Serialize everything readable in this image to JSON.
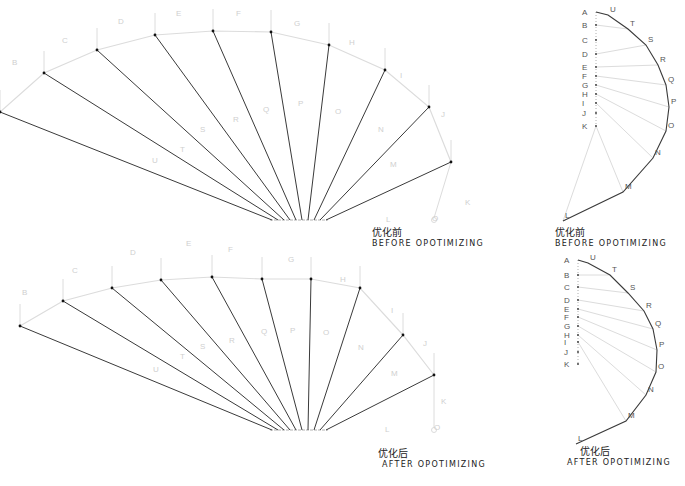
{
  "captions": {
    "before_zh": "优化前",
    "before_en": "BEFORE OPOTIMIZING",
    "after_zh": "优化后",
    "after_en": "AFTER OPOTIMIZING"
  },
  "colors": {
    "dark_line": "#3a3a3a",
    "light_line": "#dcdcdc",
    "label": "#cfcfcf",
    "label_dark": "#555555"
  },
  "diagrams": {
    "fan_before": {
      "hub": [
        [
          272,
          220
        ],
        [
          278,
          220
        ],
        [
          284,
          220
        ],
        [
          290,
          220
        ],
        [
          296,
          220
        ],
        [
          302,
          220
        ],
        [
          308,
          220
        ],
        [
          314,
          220
        ],
        [
          320,
          220
        ],
        [
          326,
          220
        ]
      ],
      "nodes": [
        {
          "id": "A",
          "x": 0,
          "y": 112,
          "lx": 0,
          "ly": 0
        },
        {
          "id": "B",
          "x": 44,
          "y": 73,
          "lx": 12,
          "ly": 65
        },
        {
          "id": "C",
          "x": 97,
          "y": 50,
          "lx": 62,
          "ly": 43
        },
        {
          "id": "D",
          "x": 155,
          "y": 35,
          "lx": 118,
          "ly": 24
        },
        {
          "id": "E",
          "x": 213,
          "y": 31,
          "lx": 176,
          "ly": 16
        },
        {
          "id": "F",
          "x": 271,
          "y": 32,
          "lx": 236,
          "ly": 16
        },
        {
          "id": "G",
          "x": 329,
          "y": 45,
          "lx": 294,
          "ly": 26
        },
        {
          "id": "H",
          "x": 385,
          "y": 70,
          "lx": 349,
          "ly": 45
        },
        {
          "id": "I",
          "x": 429,
          "y": 107,
          "lx": 400,
          "ly": 78
        },
        {
          "id": "J",
          "x": 451,
          "y": 162,
          "lx": 441,
          "ly": 117
        }
      ],
      "inner_labels": [
        {
          "t": "U",
          "x": 152,
          "y": 163
        },
        {
          "t": "T",
          "x": 180,
          "y": 152
        },
        {
          "t": "S",
          "x": 200,
          "y": 132
        },
        {
          "t": "R",
          "x": 233,
          "y": 122
        },
        {
          "t": "Q",
          "x": 263,
          "y": 112
        },
        {
          "t": "P",
          "x": 298,
          "y": 106
        },
        {
          "t": "O",
          "x": 335,
          "y": 114
        },
        {
          "t": "N",
          "x": 378,
          "y": 132
        },
        {
          "t": "M",
          "x": 390,
          "y": 167
        },
        {
          "t": "L",
          "x": 386,
          "y": 222
        },
        {
          "t": "K",
          "x": 465,
          "y": 205
        },
        {
          "t": "O",
          "x": 432,
          "y": 221
        }
      ],
      "tail": {
        "x1": 451,
        "y1": 162,
        "x2": 434,
        "y2": 218
      }
    },
    "fan_after": {
      "hub": [
        [
          272,
          430
        ],
        [
          278,
          430
        ],
        [
          284,
          430
        ],
        [
          290,
          430
        ],
        [
          296,
          430
        ],
        [
          302,
          430
        ],
        [
          308,
          430
        ],
        [
          314,
          430
        ],
        [
          320,
          430
        ],
        [
          326,
          430
        ]
      ],
      "nodes": [
        {
          "id": "A",
          "x": 20,
          "y": 326,
          "lx": 0,
          "ly": 0
        },
        {
          "id": "B",
          "x": 63,
          "y": 301,
          "lx": 22,
          "ly": 295
        },
        {
          "id": "C",
          "x": 112,
          "y": 288,
          "lx": 72,
          "ly": 273
        },
        {
          "id": "D",
          "x": 161,
          "y": 280,
          "lx": 130,
          "ly": 255
        },
        {
          "id": "E",
          "x": 212,
          "y": 277,
          "lx": 186,
          "ly": 246
        },
        {
          "id": "F",
          "x": 262,
          "y": 279,
          "lx": 228,
          "ly": 252
        },
        {
          "id": "G",
          "x": 311,
          "y": 279,
          "lx": 288,
          "ly": 262
        },
        {
          "id": "H",
          "x": 360,
          "y": 288,
          "lx": 340,
          "ly": 282
        },
        {
          "id": "I",
          "x": 403,
          "y": 335,
          "lx": 391,
          "ly": 313
        },
        {
          "id": "J",
          "x": 434,
          "y": 375,
          "lx": 423,
          "ly": 346
        }
      ],
      "inner_labels": [
        {
          "t": "U",
          "x": 153,
          "y": 372
        },
        {
          "t": "T",
          "x": 180,
          "y": 359
        },
        {
          "t": "S",
          "x": 200,
          "y": 349
        },
        {
          "t": "R",
          "x": 229,
          "y": 343
        },
        {
          "t": "Q",
          "x": 261,
          "y": 334
        },
        {
          "t": "P",
          "x": 290,
          "y": 333
        },
        {
          "t": "O",
          "x": 323,
          "y": 335
        },
        {
          "t": "N",
          "x": 358,
          "y": 350
        },
        {
          "t": "M",
          "x": 391,
          "y": 376
        },
        {
          "t": "L",
          "x": 385,
          "y": 432
        },
        {
          "t": "K",
          "x": 441,
          "y": 404
        },
        {
          "t": "O",
          "x": 434,
          "y": 430
        }
      ],
      "tail": {
        "x1": 434,
        "y1": 375,
        "x2": 434,
        "y2": 428
      }
    },
    "arc_before": {
      "spine": {
        "x": 596,
        "labels": [
          {
            "t": "A",
            "y": 12
          },
          {
            "t": "B",
            "y": 25
          },
          {
            "t": "C",
            "y": 40
          },
          {
            "t": "D",
            "y": 54
          },
          {
            "t": "E",
            "y": 67
          },
          {
            "t": "F",
            "y": 76
          },
          {
            "t": "G",
            "y": 85
          },
          {
            "t": "H",
            "y": 94
          },
          {
            "t": "I",
            "y": 103
          },
          {
            "t": "J",
            "y": 113
          },
          {
            "t": "K",
            "y": 126
          }
        ]
      },
      "arc": [
        {
          "t": "U",
          "x": 610,
          "y": 12
        },
        {
          "t": "T",
          "x": 630,
          "y": 26
        },
        {
          "t": "S",
          "x": 648,
          "y": 42
        },
        {
          "t": "R",
          "x": 660,
          "y": 62
        },
        {
          "t": "Q",
          "x": 668,
          "y": 82
        },
        {
          "t": "P",
          "x": 671,
          "y": 104
        },
        {
          "t": "O",
          "x": 668,
          "y": 128
        },
        {
          "t": "N",
          "x": 655,
          "y": 155
        },
        {
          "t": "M",
          "x": 625,
          "y": 189
        },
        {
          "t": "L",
          "x": 565,
          "y": 218
        }
      ],
      "spokes": [
        {
          "from": "B",
          "to": "T"
        },
        {
          "from": "D",
          "to": "S"
        },
        {
          "from": "E",
          "to": "R"
        },
        {
          "from": "F",
          "to": "Q"
        },
        {
          "from": "G",
          "to": "P"
        },
        {
          "from": "H",
          "to": "O"
        },
        {
          "from": "I",
          "to": "N"
        },
        {
          "from": "K",
          "to": "M"
        },
        {
          "from": "K",
          "to": "L"
        }
      ]
    },
    "arc_after": {
      "spine": {
        "x": 578,
        "labels": [
          {
            "t": "A",
            "y": 260
          },
          {
            "t": "B",
            "y": 275
          },
          {
            "t": "C",
            "y": 287
          },
          {
            "t": "D",
            "y": 300
          },
          {
            "t": "E",
            "y": 309
          },
          {
            "t": "F",
            "y": 317
          },
          {
            "t": "G",
            "y": 326
          },
          {
            "t": "H",
            "y": 335
          },
          {
            "t": "I",
            "y": 342
          },
          {
            "t": "J",
            "y": 352
          },
          {
            "t": "K",
            "y": 364
          }
        ]
      },
      "arc": [
        {
          "t": "U",
          "x": 590,
          "y": 260
        },
        {
          "t": "T",
          "x": 612,
          "y": 272
        },
        {
          "t": "S",
          "x": 630,
          "y": 290
        },
        {
          "t": "R",
          "x": 646,
          "y": 308
        },
        {
          "t": "Q",
          "x": 655,
          "y": 326
        },
        {
          "t": "P",
          "x": 659,
          "y": 347
        },
        {
          "t": "O",
          "x": 658,
          "y": 369
        },
        {
          "t": "N",
          "x": 648,
          "y": 392
        },
        {
          "t": "M",
          "x": 628,
          "y": 418
        },
        {
          "t": "L",
          "x": 578,
          "y": 441
        }
      ],
      "spokes": [
        {
          "from": "B",
          "to": "T"
        },
        {
          "from": "C",
          "to": "S"
        },
        {
          "from": "D",
          "to": "R"
        },
        {
          "from": "E",
          "to": "Q"
        },
        {
          "from": "F",
          "to": "P"
        },
        {
          "from": "G",
          "to": "O"
        },
        {
          "from": "H",
          "to": "N"
        },
        {
          "from": "I",
          "to": "M"
        }
      ]
    }
  }
}
